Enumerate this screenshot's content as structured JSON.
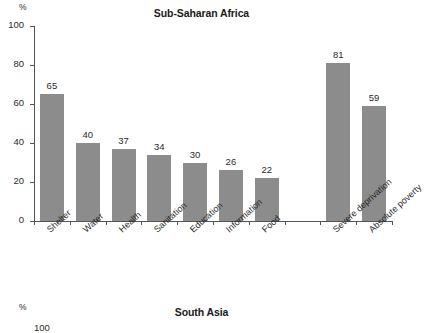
{
  "chart_data": [
    {
      "type": "bar",
      "title": "Sub-Saharan Africa",
      "xlabel": "",
      "ylabel": "%",
      "ylim": [
        0,
        100
      ],
      "yticks": [
        0,
        20,
        40,
        60,
        80,
        100
      ],
      "grid": false,
      "legend": "none",
      "bar_color": "#8c8c8c",
      "categories": [
        "Shelter",
        "Water",
        "Health",
        "Sanitation",
        "Education",
        "Information",
        "Food",
        "",
        "Severe deprivation",
        "Absolute poverty"
      ],
      "values": [
        65,
        40,
        37,
        34,
        30,
        26,
        22,
        null,
        81,
        59
      ]
    },
    {
      "type": "bar",
      "title": "South Asia",
      "ylabel": "%",
      "ylim": [
        0,
        100
      ],
      "yticks": [
        100
      ],
      "note": "clipped at bottom edge of screenshot",
      "categories": [],
      "values": []
    }
  ],
  "panels": {
    "main": {
      "title": "Sub-Saharan Africa",
      "unit": "%",
      "ytick_labels": [
        "100",
        "80",
        "60",
        "40",
        "20",
        "0"
      ],
      "bars": [
        {
          "label": "Shelter",
          "value": 65,
          "value_text": "65"
        },
        {
          "label": "Water",
          "value": 40,
          "value_text": "40"
        },
        {
          "label": "Health",
          "value": 37,
          "value_text": "37"
        },
        {
          "label": "Sanitation",
          "value": 34,
          "value_text": "34"
        },
        {
          "label": "Education",
          "value": 30,
          "value_text": "30"
        },
        {
          "label": "Information",
          "value": 26,
          "value_text": "26"
        },
        {
          "label": "Food",
          "value": 22,
          "value_text": "22"
        },
        {
          "label": "Severe deprivation",
          "value": 81,
          "value_text": "81"
        },
        {
          "label": "Absolute poverty",
          "value": 59,
          "value_text": "59"
        }
      ]
    },
    "second": {
      "title": "South Asia",
      "unit": "%",
      "first_ytick_label": "100"
    }
  },
  "colors": {
    "bar_fill": "#8c8c8c",
    "axis": "#555555",
    "text": "#1a1a1a",
    "background": "#ffffff"
  }
}
